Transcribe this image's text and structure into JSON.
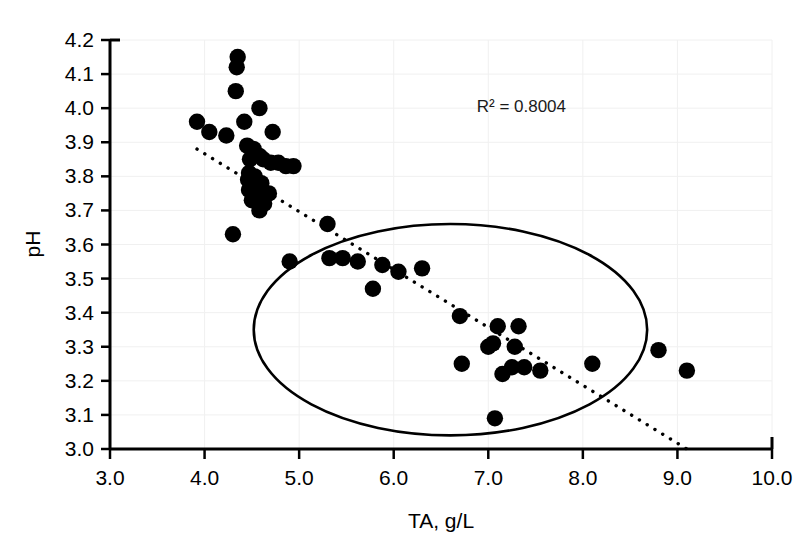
{
  "chart_data": {
    "type": "scatter",
    "title": "",
    "xlabel": "TA, g/L",
    "ylabel": "pH",
    "xlim": [
      3.0,
      10.0
    ],
    "ylim": [
      3.0,
      4.2
    ],
    "xticks": [
      "3.0",
      "4.0",
      "5.0",
      "6.0",
      "7.0",
      "8.0",
      "9.0",
      "10.0"
    ],
    "yticks": [
      "3.0",
      "3.1",
      "3.2",
      "3.3",
      "3.4",
      "3.5",
      "3.6",
      "3.7",
      "3.8",
      "3.9",
      "4.0",
      "4.1",
      "4.2"
    ],
    "grid": true,
    "legend": "none",
    "annotations": [
      {
        "name": "r-squared",
        "text": "R² = 0.8004",
        "x": 7.35,
        "y": 3.99
      }
    ],
    "series": [
      {
        "name": "pH vs TA",
        "marker": "filled-circle",
        "color": "#000000",
        "points": [
          [
            4.35,
            4.15
          ],
          [
            4.34,
            4.12
          ],
          [
            4.33,
            4.05
          ],
          [
            4.58,
            4.0
          ],
          [
            4.42,
            3.96
          ],
          [
            3.92,
            3.96
          ],
          [
            4.05,
            3.93
          ],
          [
            4.72,
            3.93
          ],
          [
            4.23,
            3.92
          ],
          [
            4.45,
            3.89
          ],
          [
            4.52,
            3.88
          ],
          [
            4.58,
            3.86
          ],
          [
            4.48,
            3.85
          ],
          [
            4.62,
            3.85
          ],
          [
            4.7,
            3.84
          ],
          [
            4.78,
            3.84
          ],
          [
            4.86,
            3.83
          ],
          [
            4.94,
            3.83
          ],
          [
            4.47,
            3.81
          ],
          [
            4.53,
            3.8
          ],
          [
            4.46,
            3.79
          ],
          [
            4.52,
            3.78
          ],
          [
            4.6,
            3.78
          ],
          [
            4.47,
            3.76
          ],
          [
            4.54,
            3.75
          ],
          [
            4.68,
            3.75
          ],
          [
            4.5,
            3.73
          ],
          [
            4.63,
            3.72
          ],
          [
            4.58,
            3.7
          ],
          [
            4.3,
            3.63
          ],
          [
            5.3,
            3.66
          ],
          [
            4.9,
            3.55
          ],
          [
            5.32,
            3.56
          ],
          [
            5.46,
            3.56
          ],
          [
            5.62,
            3.55
          ],
          [
            5.88,
            3.54
          ],
          [
            6.05,
            3.52
          ],
          [
            6.3,
            3.53
          ],
          [
            5.78,
            3.47
          ],
          [
            6.7,
            3.39
          ],
          [
            7.1,
            3.36
          ],
          [
            7.32,
            3.36
          ],
          [
            7.05,
            3.31
          ],
          [
            7.28,
            3.3
          ],
          [
            7.0,
            3.3
          ],
          [
            7.25,
            3.24
          ],
          [
            7.38,
            3.24
          ],
          [
            7.55,
            3.23
          ],
          [
            6.72,
            3.25
          ],
          [
            7.15,
            3.22
          ],
          [
            8.1,
            3.25
          ],
          [
            8.8,
            3.29
          ],
          [
            9.1,
            3.23
          ],
          [
            7.07,
            3.09
          ]
        ]
      }
    ],
    "trendline": {
      "name": "linear-fit-dotted",
      "style": "dotted",
      "x_start": 3.92,
      "y_start": 3.88,
      "x_end": 9.1,
      "y_end": 3.0
    },
    "highlight_region": {
      "name": "ellipse-highlight",
      "shape": "ellipse",
      "center_x": 6.6,
      "center_y": 3.35,
      "radius_x": 2.08,
      "radius_y": 0.31
    }
  }
}
